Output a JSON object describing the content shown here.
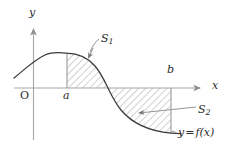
{
  "figure": {
    "type": "math-diagram",
    "background_color": "#ffffff",
    "axis_color": "#9a9a9a",
    "curve_color": "#333333",
    "hatch_color": "#8c8c8c",
    "label_color": "#2b2b2b"
  },
  "axes": {
    "y_label": "y",
    "x_label": "x",
    "origin_label": "O",
    "x_axis_y_px": 88,
    "y_axis_x_px": 33,
    "x_axis_arrow_tip_px": 206,
    "y_axis_arrow_tip_px": 23
  },
  "marks": {
    "a_label": "a",
    "b_label": "b",
    "a_x_px": 67,
    "b_x_px": 171,
    "zero_crossing_x_px": 108
  },
  "regions": [
    {
      "name": "S1",
      "label": "S",
      "subscript": "1",
      "position": "above x-axis between a and zero crossing",
      "hatch_angle_deg": 45
    },
    {
      "name": "S2",
      "label": "S",
      "subscript": "2",
      "position": "below x-axis between zero crossing and b",
      "hatch_angle_deg": 45
    }
  ],
  "curve": {
    "label_y": "y",
    "label_equals": "=",
    "label_f": "f",
    "label_open": "(",
    "label_x": "x",
    "label_close": ")",
    "full_label": "y = f(x)",
    "shape": "rises from lower-left, peaks near x=67, descends through zero at x=108, falls to lower-right"
  }
}
